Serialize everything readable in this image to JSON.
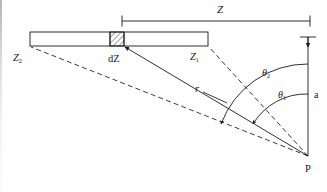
{
  "figure": {
    "labels": {
      "z_total": "Z",
      "z_one_base": "Z",
      "z_one_sub": "1",
      "z_two_base": "Z",
      "z_two_sub": "2",
      "dz": "dZ",
      "r": "r",
      "theta_one_base": "θ",
      "theta_one_sub": "1",
      "theta_two_base": "θ",
      "theta_two_sub": "2",
      "a": "a",
      "point_p": "P"
    },
    "colors": {
      "ink": "#17181a",
      "paper": "#ffffff",
      "hatch": "#2a2b2d"
    }
  },
  "geometry": {
    "bar": {
      "x1": 30,
      "y1": 32,
      "x2": 208,
      "y2": 46
    },
    "element_dz": {
      "x1": 110,
      "y1": 32,
      "x2": 124,
      "y2": 46
    },
    "point_p": {
      "x": 308,
      "y": 156
    },
    "axis_a": {
      "x": 308,
      "y_top": 37,
      "y_bottom": 156
    },
    "dimension_z": {
      "x1": 122,
      "x2": 310,
      "y": 21
    },
    "arc_theta_one_radius": 62,
    "arc_theta_two_radius": 92
  }
}
